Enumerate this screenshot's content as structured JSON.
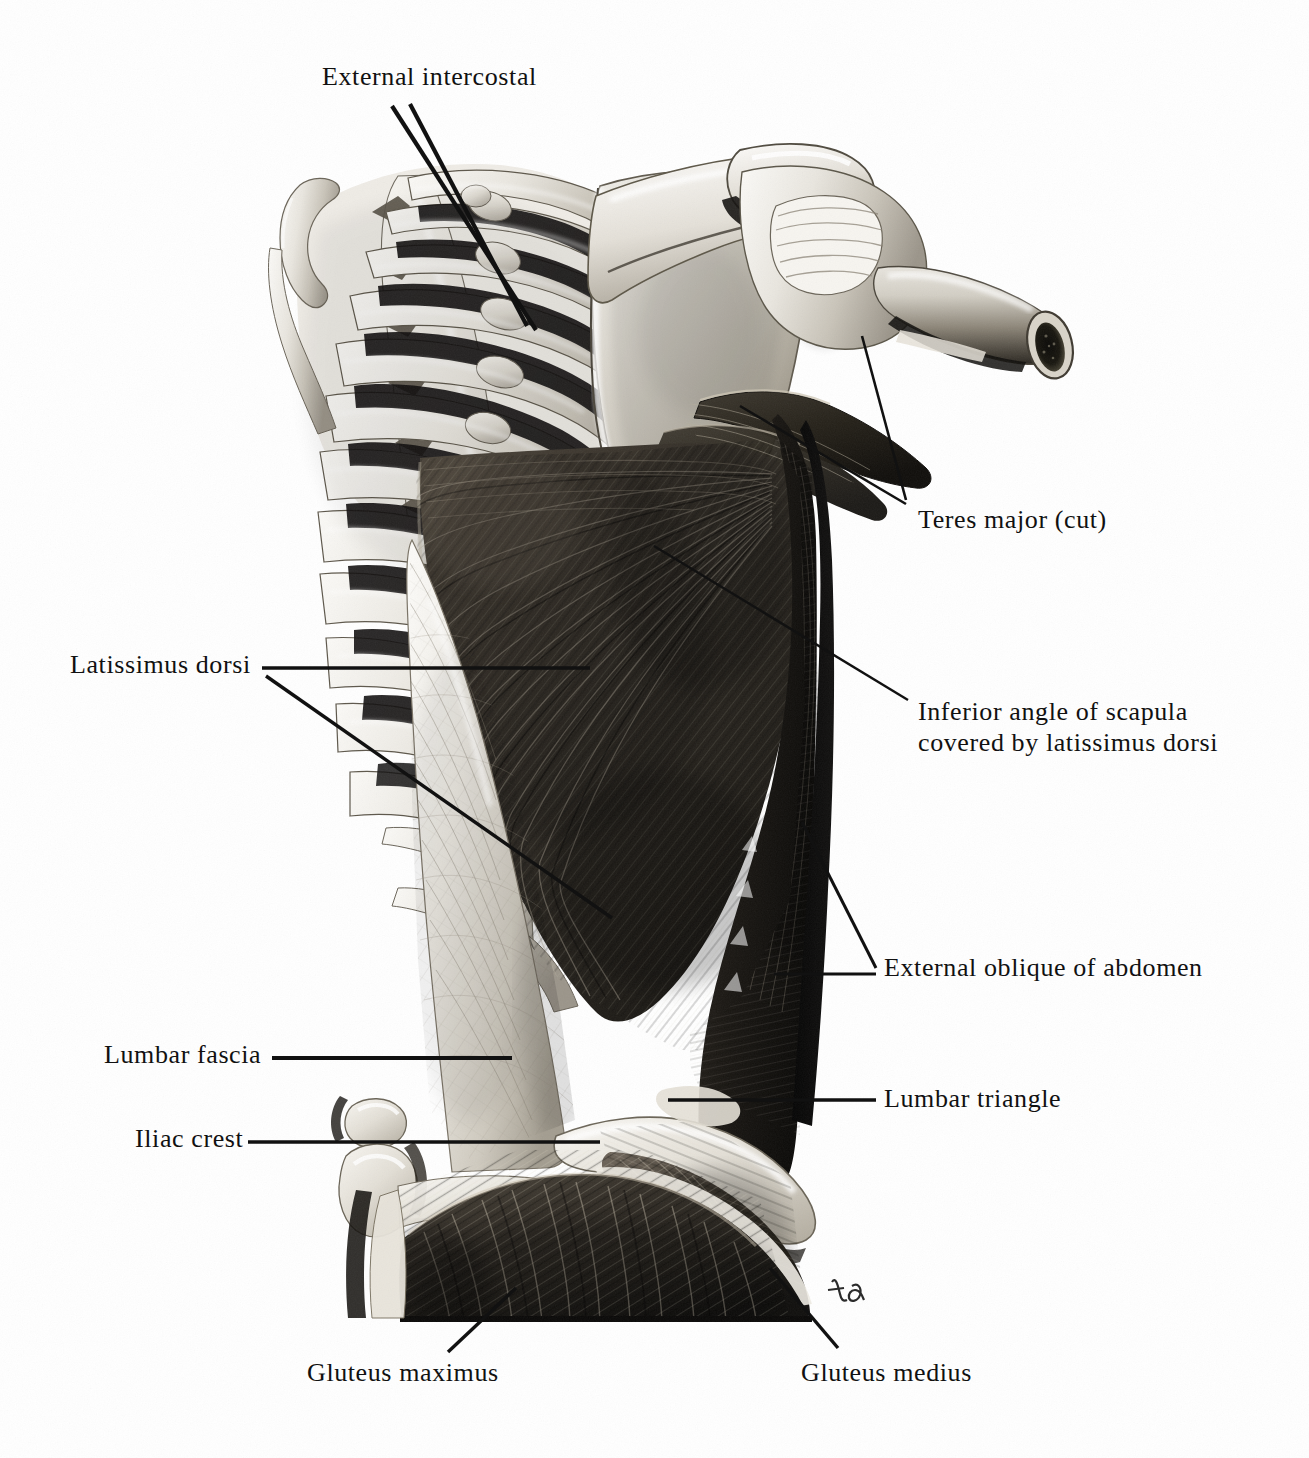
{
  "plate": {
    "kind": "anatomical-illustration",
    "subject": "Superficial muscles of the back, right posterolateral view",
    "background_color": "#ffffff",
    "ink_color": "#111111",
    "artist_signature": "td"
  },
  "labels": [
    {
      "id": "external-intercostal",
      "text": "External intercostal",
      "side": "top",
      "x": 322,
      "y": 72,
      "leaders": 2
    },
    {
      "id": "teres-major-cut",
      "text": "Teres major (cut)",
      "side": "right",
      "x": 918,
      "y": 514,
      "leaders": 2
    },
    {
      "id": "inferior-angle-of-scapula",
      "line1": "Inferior angle of scapula",
      "line2": "covered by latissimus dorsi",
      "side": "right",
      "x": 918,
      "y": 705,
      "leaders": 1
    },
    {
      "id": "latissimus-dorsi",
      "text": "Latissimus dorsi",
      "side": "left",
      "x": 70,
      "y": 656,
      "leaders": 2
    },
    {
      "id": "external-oblique-of-abdomen",
      "text": "External oblique of abdomen",
      "side": "right",
      "x": 884,
      "y": 960,
      "leaders": 2
    },
    {
      "id": "lumbar-fascia",
      "text": "Lumbar fascia",
      "side": "left",
      "x": 104,
      "y": 1046,
      "leaders": 1
    },
    {
      "id": "lumbar-triangle",
      "text": "Lumbar triangle",
      "side": "right",
      "x": 884,
      "y": 1082,
      "leaders": 1
    },
    {
      "id": "iliac-crest",
      "text": "Iliac crest",
      "side": "left",
      "x": 135,
      "y": 1127,
      "leaders": 1
    },
    {
      "id": "gluteus-maximus",
      "text": "Gluteus maximus",
      "side": "bottom",
      "x": 307,
      "y": 1366,
      "leaders": 1
    },
    {
      "id": "gluteus-medius",
      "text": "Gluteus medius",
      "side": "bottom",
      "x": 801,
      "y": 1366,
      "leaders": 1
    }
  ],
  "structures": [
    {
      "id": "rib-cage",
      "name": "Ribs with intercostal spaces"
    },
    {
      "id": "vertebral-column",
      "name": "Thoracic and lumbar spinous processes"
    },
    {
      "id": "scapula",
      "name": "Scapula with spine and acromion"
    },
    {
      "id": "humerus-cut",
      "name": "Humerus, cut shaft showing medullary cavity"
    },
    {
      "id": "latissimus-dorsi-muscle",
      "name": "Latissimus dorsi"
    },
    {
      "id": "teres-major-muscle",
      "name": "Teres major, cut"
    },
    {
      "id": "external-oblique-muscle",
      "name": "External oblique of abdomen"
    },
    {
      "id": "lumbar-fascia-sheet",
      "name": "Lumbar (thoracolumbar) fascia"
    },
    {
      "id": "ilium",
      "name": "Ilium and iliac crest"
    },
    {
      "id": "gluteus-medius-muscle",
      "name": "Gluteus medius"
    },
    {
      "id": "gluteus-maximus-muscle",
      "name": "Gluteus maximus"
    }
  ]
}
